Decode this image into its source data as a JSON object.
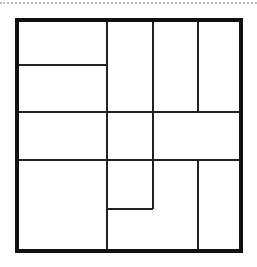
{
  "diagram": {
    "type": "rectangle-partition",
    "outer_frame": {
      "x": 15,
      "y": 18,
      "width": 228,
      "height": 235,
      "border": 4,
      "color": "#111111"
    },
    "line_color": "#222222",
    "separator_color": "#bdbdbd",
    "segments": [
      {
        "id": "h-top-left",
        "orientation": "h",
        "x1": 19,
        "x2": 107,
        "y": 65
      },
      {
        "id": "h-mid-1",
        "orientation": "h",
        "x1": 19,
        "x2": 239,
        "y": 112
      },
      {
        "id": "h-mid-2",
        "orientation": "h",
        "x1": 19,
        "x2": 239,
        "y": 160
      },
      {
        "id": "h-bottom-small",
        "orientation": "h",
        "x1": 107,
        "x2": 153,
        "y": 209
      },
      {
        "id": "v-a",
        "orientation": "v",
        "x": 107,
        "y1": 22,
        "y2": 249
      },
      {
        "id": "v-b-top",
        "orientation": "v",
        "x": 153,
        "y1": 22,
        "y2": 209
      },
      {
        "id": "v-c-top",
        "orientation": "v",
        "x": 198,
        "y1": 22,
        "y2": 112
      },
      {
        "id": "v-c-bottom",
        "orientation": "v",
        "x": 198,
        "y1": 160,
        "y2": 249
      }
    ],
    "cell_count": 12
  }
}
